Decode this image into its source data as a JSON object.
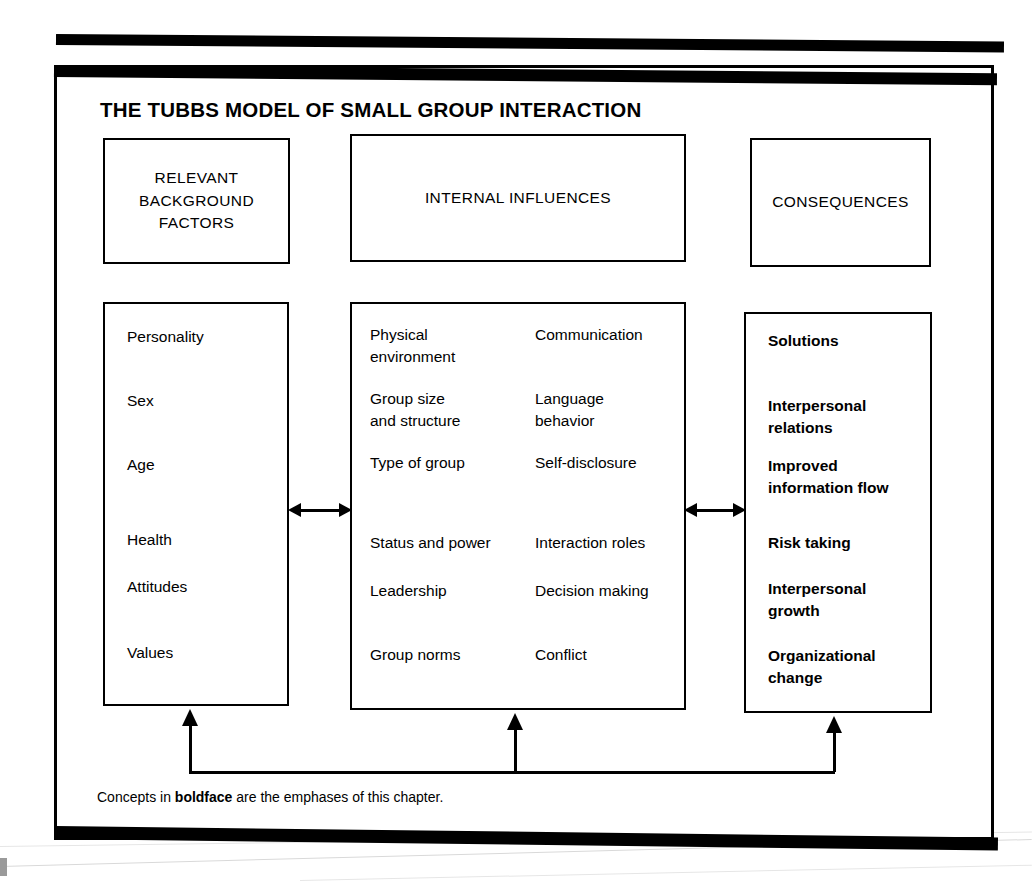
{
  "title": "THE TUBBS MODEL OF SMALL GROUP INTERACTION",
  "headers": {
    "background": "RELEVANT\nBACKGROUND\nFACTORS",
    "internal": "INTERNAL INFLUENCES",
    "consequences": "CONSEQUENCES"
  },
  "columns": {
    "background_factors": [
      "Personality",
      "Sex",
      "Age",
      "Health",
      "Attitudes",
      "Values"
    ],
    "internal_influences_left": [
      "Physical\nenvironment",
      "Group size\nand structure",
      "Type of group",
      "Status and power",
      "Leadership",
      "Group norms"
    ],
    "internal_influences_right": [
      "Communication",
      "Language\nbehavior",
      "Self-disclosure",
      "Interaction roles",
      "Decision making",
      "Conflict"
    ],
    "consequences": [
      "Solutions",
      "Interpersonal\nrelations",
      "Improved\ninformation flow",
      "Risk taking",
      "Interpersonal\ngrowth",
      "Organizational\nchange"
    ]
  },
  "caption": {
    "prefix": "Concepts in ",
    "emphasis": "boldface",
    "suffix": " are the emphases of this chapter."
  },
  "colors": {
    "ink": "#000000",
    "paper": "#ffffff"
  }
}
